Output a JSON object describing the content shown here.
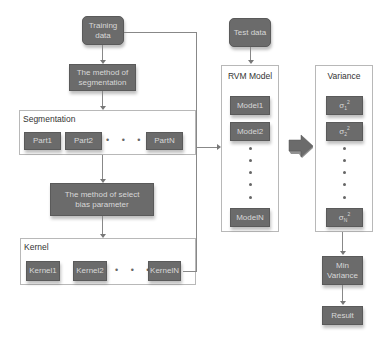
{
  "diagram": {
    "training_data": "Training data",
    "method_segmentation": "The method of segmentation",
    "segmentation": {
      "title": "Segmentation",
      "parts": [
        "Part1",
        "Part2",
        "PartN"
      ],
      "ellipsis": "• • • •"
    },
    "method_select_bias": "The method of select bias parameter",
    "kernel": {
      "title": "Kernel",
      "items": [
        "Kernel1",
        "Kernel2",
        "KernelN"
      ],
      "ellipsis": "• • •"
    },
    "test_data": "Test data",
    "rvm": {
      "title": "RVM Model",
      "models": [
        "Model1",
        "Model2",
        "ModelN"
      ]
    },
    "variance": {
      "title": "Variance",
      "items": [
        {
          "symbol": "σ",
          "sub": "1",
          "sup": "2"
        },
        {
          "symbol": "σ",
          "sub": "2",
          "sup": "2"
        },
        {
          "symbol": "σ",
          "sub": "N",
          "sup": "2"
        }
      ]
    },
    "min_variance": "Min Variance",
    "result": "Result"
  },
  "colors": {
    "box_fill": "#6b6b6b",
    "box_text": "#d8d8d8",
    "container_border": "#b8b8b8",
    "connector": "#888888"
  }
}
